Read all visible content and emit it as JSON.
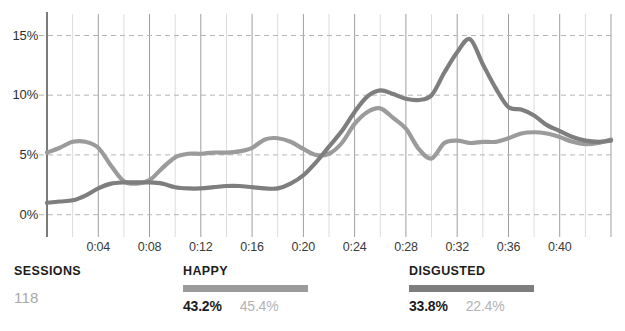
{
  "chart_data": {
    "type": "line",
    "title": "",
    "xlabel": "",
    "ylabel": "",
    "grid": true,
    "legend_position": "bottom",
    "ylim": [
      -1.2,
      16.8
    ],
    "yticks": [
      0,
      5,
      10,
      15
    ],
    "ytick_labels": [
      "0%",
      "5%",
      "10%",
      "15%"
    ],
    "xlim": [
      0,
      44
    ],
    "xticks": [
      4,
      8,
      12,
      16,
      20,
      24,
      28,
      32,
      36,
      40
    ],
    "xtick_labels": [
      "0:04",
      "0:08",
      "0:12",
      "0:16",
      "0:20",
      "0:24",
      "0:28",
      "0:32",
      "0:36",
      "0:40"
    ],
    "x": [
      0,
      1,
      2,
      3,
      4,
      5,
      6,
      7,
      8,
      9,
      10,
      11,
      12,
      13,
      14,
      15,
      16,
      17,
      18,
      19,
      20,
      21,
      22,
      23,
      24,
      25,
      26,
      27,
      28,
      29,
      30,
      31,
      32,
      33,
      34,
      35,
      36,
      37,
      38,
      39,
      40,
      41,
      42,
      43,
      44
    ],
    "series": [
      {
        "name": "HAPPY",
        "color": "#9b9b9b",
        "values": [
          5.2,
          5.6,
          6.1,
          6.1,
          5.6,
          4.1,
          2.8,
          2.6,
          2.9,
          3.9,
          4.8,
          5.1,
          5.1,
          5.2,
          5.2,
          5.3,
          5.6,
          6.3,
          6.4,
          6.1,
          5.5,
          5.0,
          5.1,
          6.0,
          7.6,
          8.6,
          8.9,
          8.1,
          7.2,
          5.5,
          4.7,
          6.0,
          6.2,
          6.0,
          6.1,
          6.1,
          6.4,
          6.8,
          6.9,
          6.8,
          6.5,
          6.1,
          5.9,
          6.0,
          6.3
        ]
      },
      {
        "name": "DISGUSTED",
        "color": "#7e7e7e",
        "values": [
          1.0,
          1.1,
          1.2,
          1.6,
          2.2,
          2.6,
          2.7,
          2.7,
          2.7,
          2.6,
          2.3,
          2.2,
          2.2,
          2.3,
          2.4,
          2.4,
          2.3,
          2.2,
          2.2,
          2.6,
          3.3,
          4.4,
          5.7,
          7.0,
          8.6,
          9.9,
          10.4,
          10.1,
          9.7,
          9.6,
          10.0,
          11.9,
          13.6,
          14.7,
          12.6,
          10.6,
          9.0,
          8.8,
          8.3,
          7.5,
          7.0,
          6.5,
          6.2,
          6.1,
          6.2
        ]
      }
    ]
  },
  "footer": {
    "sessions": {
      "label": "SESSIONS",
      "value": "118"
    },
    "legends": [
      {
        "label": "HAPPY",
        "primary": "43.2%",
        "secondary": "45.4%",
        "color": "#9b9b9b"
      },
      {
        "label": "DISGUSTED",
        "primary": "33.8%",
        "secondary": "22.4%",
        "color": "#7e7e7e"
      }
    ]
  },
  "colors": {
    "axis": "#5a5a5a",
    "grid_major": "#9f9f9f",
    "grid_minor": "#dcdcdc",
    "grid_dash": "#b5b5b5",
    "text_dark": "#1d1d1d",
    "text_muted": "#b3b3b3"
  }
}
